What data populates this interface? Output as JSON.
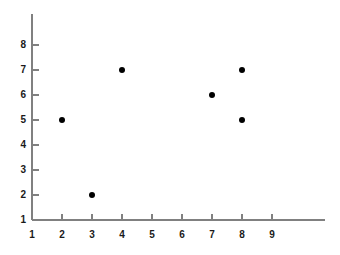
{
  "chart_data": {
    "type": "scatter",
    "title": "",
    "subtitle": "",
    "xlabel": "",
    "ylabel": "",
    "points": [
      {
        "x": 2,
        "y": 5
      },
      {
        "x": 3,
        "y": 2
      },
      {
        "x": 4,
        "y": 7
      },
      {
        "x": 7,
        "y": 6
      },
      {
        "x": 8,
        "y": 7
      },
      {
        "x": 8,
        "y": 5
      }
    ],
    "x_ticks": [
      1,
      2,
      3,
      4,
      5,
      6,
      7,
      8,
      9
    ],
    "y_ticks": [
      1,
      2,
      3,
      4,
      5,
      6,
      7,
      8
    ],
    "xlim": [
      1,
      9
    ],
    "ylim": [
      1,
      8
    ],
    "grid": false,
    "legend": null,
    "marker": {
      "shape": "circle",
      "color": "#000000",
      "size_px": 6
    },
    "axis_color": "#808080",
    "background_color": "#ffffff",
    "tick_label_color": "#1a1a1a"
  }
}
